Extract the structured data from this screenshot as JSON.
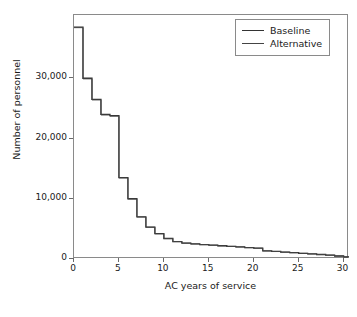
{
  "chart_data": {
    "type": "line",
    "title": "",
    "xlabel": "AC years of service",
    "ylabel": "Number of personnel",
    "xlim": [
      0,
      30.6
    ],
    "ylim": [
      0,
      40500
    ],
    "xticks": [
      0,
      5,
      10,
      15,
      20,
      25,
      30
    ],
    "xtick_labels": [
      "0",
      "5",
      "10",
      "15",
      "20",
      "25",
      "30"
    ],
    "yticks": [
      0,
      10000,
      20000,
      30000
    ],
    "ytick_labels": [
      "0",
      "10,000",
      "20,000",
      "30,000"
    ],
    "grid": false,
    "drawstyle": "steps-post",
    "legend_position": "top-right",
    "x": [
      0,
      1,
      2,
      3,
      4,
      5,
      6,
      7,
      8,
      9,
      10,
      11,
      12,
      13,
      14,
      15,
      16,
      17,
      18,
      19,
      20,
      21,
      22,
      23,
      24,
      25,
      26,
      27,
      28,
      29,
      30
    ],
    "series": [
      {
        "name": "Baseline",
        "color": "#333333",
        "values": [
          38500,
          30000,
          26500,
          24000,
          23800,
          13500,
          10000,
          7000,
          5300,
          4200,
          3400,
          2900,
          2650,
          2500,
          2400,
          2300,
          2200,
          2100,
          2000,
          1900,
          1800,
          1350,
          1250,
          1150,
          1050,
          950,
          850,
          750,
          650,
          500,
          350
        ]
      },
      {
        "name": "Alternative",
        "color": "#444444",
        "values": [
          38400,
          29900,
          26400,
          23900,
          23700,
          13450,
          9960,
          6980,
          5280,
          4180,
          3390,
          2890,
          2640,
          2490,
          2390,
          2290,
          2190,
          2090,
          1990,
          1890,
          1790,
          1340,
          1240,
          1140,
          1040,
          940,
          840,
          740,
          640,
          495,
          345
        ]
      }
    ]
  },
  "legend": {
    "items": [
      {
        "label": "Baseline",
        "color": "#333333"
      },
      {
        "label": "Alternative",
        "color": "#444444"
      }
    ]
  }
}
